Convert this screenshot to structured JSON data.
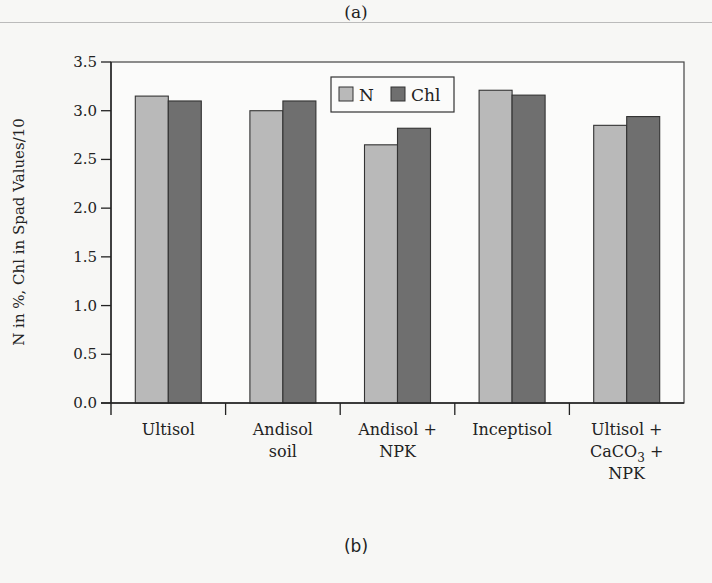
{
  "captions": {
    "top": "(a)",
    "bottom": "(b)"
  },
  "chart_data": {
    "type": "bar",
    "title": "",
    "xlabel": "",
    "ylabel": "N in %, Chl in Spad Values/10",
    "ylim": [
      0,
      3.5
    ],
    "yticks": [
      "0.0",
      "0.5",
      "1.0",
      "1.5",
      "2.0",
      "2.5",
      "3.0",
      "3.5"
    ],
    "grid": false,
    "legend_position": "top-center (inside plot)",
    "categories": [
      [
        "Ultisol"
      ],
      [
        "Andisol",
        "soil"
      ],
      [
        "Andisol +",
        "NPK"
      ],
      [
        "Inceptisol"
      ],
      [
        "Ultisol +",
        "CaCO3 +",
        "NPK"
      ]
    ],
    "category_names": [
      "Ultisol",
      "Andisol soil",
      "Andisol + NPK",
      "Inceptisol",
      "Ultisol + CaCO3 + NPK"
    ],
    "series": [
      {
        "name": "N",
        "color": "#b9b9b9",
        "values": [
          3.15,
          3.0,
          2.65,
          3.21,
          2.85
        ]
      },
      {
        "name": "Chl",
        "color": "#6f6f6f",
        "values": [
          3.1,
          3.1,
          2.82,
          3.16,
          2.94
        ]
      }
    ]
  },
  "colors": {
    "border": "#333333",
    "axis": "#222222"
  }
}
